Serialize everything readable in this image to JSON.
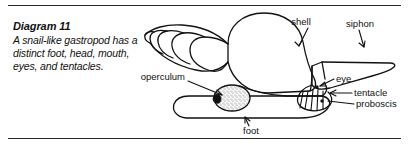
{
  "caption": {
    "title": "Diagram 11",
    "body": "A snail-like gastropod has a distinct foot, head, mouth, eyes, and tentacles."
  },
  "figure": {
    "labels": [
      {
        "key": "shell",
        "text": "shell"
      },
      {
        "key": "siphon",
        "text": "siphon"
      },
      {
        "key": "operculum",
        "text": "operculum"
      },
      {
        "key": "eye",
        "text": "eye"
      },
      {
        "key": "tentacle",
        "text": "tentacle"
      },
      {
        "key": "proboscis",
        "text": "proboscis"
      },
      {
        "key": "foot",
        "text": "foot"
      }
    ]
  },
  "colors": {
    "ink": "#111111",
    "rule": "#2b2b2b",
    "background": "#ffffff",
    "stipple": "#555555"
  }
}
